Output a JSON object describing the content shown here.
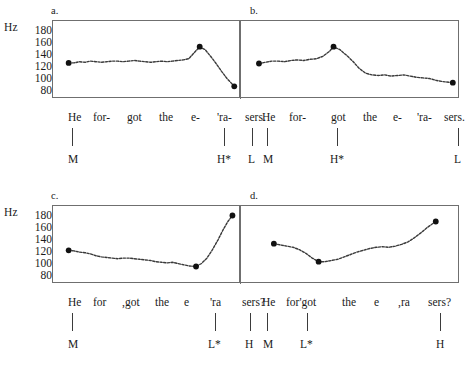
{
  "figure": {
    "axis_label": "Hz",
    "y_ticks": [
      "180",
      "160",
      "140",
      "120",
      "100",
      "80"
    ],
    "y_range": [
      70,
      190
    ]
  },
  "panels": [
    {
      "letter": "a.",
      "words": [
        "He",
        "for-",
        "got",
        "the",
        "e-",
        "'ra-",
        "sers."
      ],
      "word_x": [
        8,
        40,
        78,
        110,
        142,
        172,
        200
      ],
      "tones": [
        {
          "label": "M",
          "x": 12
        },
        {
          "label": "H*",
          "x": 176
        },
        {
          "label": "L",
          "x": 206
        }
      ],
      "chart_data": {
        "type": "line",
        "title": "a.",
        "xlabel": "",
        "ylabel": "Hz",
        "ylim": [
          70,
          190
        ],
        "yticks": [
          80,
          100,
          120,
          140,
          160,
          180
        ],
        "units": "Hz",
        "description": "F0 contour for declarative 'He forgot the erasers.' with H* L L% nuclear configuration",
        "anchor_points": [
          {
            "label": "M",
            "x": 0.075,
            "value": 121
          },
          {
            "label": "H*",
            "x": 0.795,
            "value": 148
          },
          {
            "label": "L",
            "x": 0.985,
            "value": 82
          }
        ],
        "x": [
          0.075,
          0.105,
          0.135,
          0.165,
          0.195,
          0.225,
          0.255,
          0.285,
          0.315,
          0.345,
          0.375,
          0.405,
          0.435,
          0.465,
          0.495,
          0.525,
          0.555,
          0.585,
          0.615,
          0.645,
          0.675,
          0.705,
          0.735,
          0.765,
          0.795,
          0.825,
          0.855,
          0.885,
          0.915,
          0.945,
          0.985
        ],
        "values": [
          121,
          121,
          123,
          122,
          124,
          123,
          122,
          123,
          124,
          124,
          123,
          124,
          125,
          124,
          123,
          122,
          123,
          124,
          123,
          124,
          125,
          126,
          128,
          138,
          148,
          143,
          132,
          120,
          107,
          95,
          82
        ]
      }
    },
    {
      "letter": "b.",
      "words": [
        "He",
        "for-",
        "got",
        "the",
        "e-",
        "'ra-",
        "sers."
      ],
      "word_x": [
        8,
        40,
        84,
        116,
        146,
        172,
        200
      ],
      "tones": [
        {
          "label": "M",
          "x": 12
        },
        {
          "label": "H*",
          "x": 88
        },
        {
          "label": "L",
          "x": 206
        }
      ],
      "chart_data": {
        "type": "line",
        "title": "b.",
        "xlabel": "",
        "ylabel": "Hz",
        "ylim": [
          70,
          190
        ],
        "yticks": [
          80,
          100,
          120,
          140,
          160,
          180
        ],
        "units": "Hz",
        "description": "F0 contour for declarative 'He forgot the erasers.' with early H* on 'got' then long low tail",
        "anchor_points": [
          {
            "label": "M",
            "x": 0.075,
            "value": 120
          },
          {
            "label": "H*",
            "x": 0.425,
            "value": 148
          },
          {
            "label": "L",
            "x": 0.985,
            "value": 88
          }
        ],
        "x": [
          0.075,
          0.105,
          0.135,
          0.165,
          0.195,
          0.225,
          0.255,
          0.285,
          0.315,
          0.345,
          0.375,
          0.405,
          0.425,
          0.455,
          0.485,
          0.515,
          0.545,
          0.575,
          0.605,
          0.635,
          0.665,
          0.695,
          0.725,
          0.755,
          0.785,
          0.815,
          0.845,
          0.875,
          0.905,
          0.935,
          0.985
        ],
        "values": [
          120,
          122,
          124,
          124,
          123,
          125,
          126,
          125,
          127,
          128,
          132,
          140,
          148,
          143,
          134,
          124,
          112,
          104,
          101,
          100,
          101,
          99,
          100,
          101,
          99,
          97,
          96,
          95,
          92,
          90,
          88
        ]
      }
    },
    {
      "letter": "c.",
      "words": [
        "He",
        "for",
        ",got",
        "the",
        "e",
        "'ra",
        "sers?"
      ],
      "word_x": [
        8,
        40,
        72,
        104,
        136,
        162,
        194
      ],
      "tones": [
        {
          "label": "M",
          "x": 12
        },
        {
          "label": "L*",
          "x": 166
        },
        {
          "label": "H",
          "x": 202
        }
      ],
      "chart_data": {
        "type": "line",
        "title": "c.",
        "xlabel": "",
        "ylabel": "Hz",
        "ylim": [
          70,
          190
        ],
        "yticks": [
          80,
          100,
          120,
          140,
          160,
          180
        ],
        "units": "Hz",
        "description": "F0 contour for yes-no question 'He forgot the erasers?' with L* H H% final rise",
        "anchor_points": [
          {
            "label": "M",
            "x": 0.075,
            "value": 117
          },
          {
            "label": "L*",
            "x": 0.775,
            "value": 90
          },
          {
            "label": "H",
            "x": 0.975,
            "value": 175
          }
        ],
        "x": [
          0.075,
          0.105,
          0.135,
          0.165,
          0.195,
          0.225,
          0.255,
          0.285,
          0.315,
          0.345,
          0.375,
          0.405,
          0.435,
          0.465,
          0.495,
          0.525,
          0.555,
          0.585,
          0.615,
          0.645,
          0.675,
          0.705,
          0.735,
          0.775,
          0.805,
          0.835,
          0.865,
          0.895,
          0.925,
          0.95,
          0.975
        ],
        "values": [
          117,
          116,
          114,
          113,
          111,
          108,
          106,
          105,
          104,
          103,
          104,
          104,
          103,
          102,
          101,
          100,
          98,
          97,
          96,
          97,
          95,
          93,
          91,
          90,
          95,
          104,
          118,
          134,
          152,
          165,
          175
        ]
      }
    },
    {
      "letter": "d.",
      "words": [
        "He",
        "for'got",
        "the",
        "e",
        ",ra",
        "sers?"
      ],
      "word_x": [
        6,
        34,
        88,
        118,
        144,
        176
      ],
      "tones": [
        {
          "label": "M",
          "x": 10
        },
        {
          "label": "L*",
          "x": 52
        },
        {
          "label": "H",
          "x": 190
        }
      ],
      "chart_data": {
        "type": "line",
        "title": "d.",
        "xlabel": "",
        "ylabel": "Hz",
        "ylim": [
          70,
          190
        ],
        "yticks": [
          80,
          100,
          120,
          140,
          160,
          180
        ],
        "units": "Hz",
        "description": "F0 contour for yes-no question 'He forgot the erasers?' with early L* then gradual rise to final H",
        "anchor_points": [
          {
            "label": "M",
            "x": 0.145,
            "value": 128
          },
          {
            "label": "L*",
            "x": 0.355,
            "value": 98
          },
          {
            "label": "H",
            "x": 0.905,
            "value": 165
          }
        ],
        "x": [
          0.145,
          0.175,
          0.205,
          0.235,
          0.265,
          0.295,
          0.325,
          0.355,
          0.385,
          0.415,
          0.445,
          0.475,
          0.505,
          0.535,
          0.565,
          0.595,
          0.625,
          0.655,
          0.685,
          0.715,
          0.745,
          0.775,
          0.805,
          0.835,
          0.865,
          0.905
        ],
        "values": [
          128,
          126,
          124,
          122,
          118,
          112,
          104,
          98,
          98,
          100,
          102,
          106,
          110,
          114,
          117,
          120,
          122,
          123,
          122,
          124,
          127,
          131,
          138,
          146,
          155,
          165
        ]
      }
    }
  ]
}
